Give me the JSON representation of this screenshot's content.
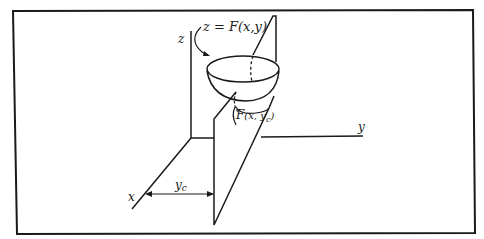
{
  "figure": {
    "stroke_color": "#1a1a1a",
    "background": "#ffffff",
    "labels": {
      "z_axis": "z",
      "y_axis": "y",
      "x_axis": "x",
      "surface": "z = F(x,y)",
      "section_func": "F",
      "section_args_open": "(x, y",
      "section_sub": "c",
      "section_args_close": ")",
      "yc_main": "y",
      "yc_sub": "c"
    }
  }
}
